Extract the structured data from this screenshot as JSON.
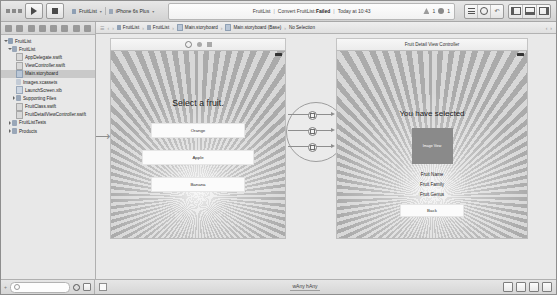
{
  "toolbar": {
    "run_label": "run-button",
    "stop_label": "stop-button",
    "scheme_name": "FruitList",
    "destination": "iPhone 6s Plus",
    "activity": {
      "project": "FruitList",
      "task": "Convert FruitList:",
      "status": "Failed",
      "time": "Today at 10:43",
      "warning_count": "1",
      "error_count": "1"
    },
    "editor_modes": [
      "standard-editor",
      "assistant-editor",
      "version-editor"
    ],
    "panel_toggles": [
      "navigator-toggle",
      "debug-area-toggle",
      "utilities-toggle"
    ]
  },
  "navigator": {
    "tabs": [
      "project-navigator-tab",
      "symbol-navigator-tab",
      "find-navigator-tab",
      "issue-navigator-tab",
      "test-navigator-tab",
      "debug-navigator-tab",
      "breakpoint-navigator-tab",
      "report-navigator-tab"
    ],
    "tree": [
      {
        "label": "FruitList",
        "indent": 0,
        "icon": "proj",
        "twist": "open",
        "selected": false
      },
      {
        "label": "FruitList",
        "indent": 1,
        "icon": "fold",
        "twist": "open",
        "selected": false
      },
      {
        "label": "AppDelegate.swift",
        "indent": 2,
        "icon": "swift",
        "twist": "none",
        "selected": false
      },
      {
        "label": "ViewController.swift",
        "indent": 2,
        "icon": "swift",
        "twist": "none",
        "selected": false
      },
      {
        "label": "Main.storyboard",
        "indent": 2,
        "icon": "story",
        "twist": "none",
        "selected": true
      },
      {
        "label": "Images.xcassets",
        "indent": 2,
        "icon": "assets",
        "twist": "none",
        "selected": false
      },
      {
        "label": "LaunchScreen.xib",
        "indent": 2,
        "icon": "xib",
        "twist": "none",
        "selected": false
      },
      {
        "label": "Supporting Files",
        "indent": 2,
        "icon": "fold",
        "twist": "closed",
        "selected": false
      },
      {
        "label": "FruitClass.swift",
        "indent": 2,
        "icon": "swift",
        "twist": "none",
        "selected": false
      },
      {
        "label": "FruitDetailViewController.swift",
        "indent": 2,
        "icon": "swift",
        "twist": "none",
        "selected": false
      },
      {
        "label": "FruitListTests",
        "indent": 1,
        "icon": "fold",
        "twist": "closed",
        "selected": false
      },
      {
        "label": "Products",
        "indent": 1,
        "icon": "fold",
        "twist": "closed",
        "selected": false
      }
    ],
    "filter_placeholder": ""
  },
  "jumpbar": {
    "crumbs": [
      {
        "label": "FruitList",
        "icon": "p"
      },
      {
        "label": "FruitList",
        "icon": "f"
      },
      {
        "label": "Main.storyboard",
        "icon": "s"
      },
      {
        "label": "Main.storyboard (Base)",
        "icon": "s"
      },
      {
        "label": "No Selection",
        "icon": ""
      }
    ]
  },
  "canvas": {
    "scene_left": {
      "dock_icons": [
        "view-controller-icon",
        "first-responder-icon",
        "exit-icon"
      ],
      "title": "Select a fruit.",
      "buttons": [
        "Orange",
        "Apple",
        "Banana"
      ]
    },
    "scene_right": {
      "dock_title": "Fruit Detail View Controller",
      "title": "You have selected",
      "image_view_label": "Image View",
      "labels": [
        "Fruit Name",
        "Fruit Family",
        "Fruit Genus"
      ],
      "back_button": "Back"
    },
    "segue_count": 3
  },
  "bottombar": {
    "size_class": "wAny hAny",
    "ib_tools": [
      "align-button",
      "pin-button",
      "resolve-issues-button",
      "embed-in-stack-button"
    ],
    "zoom_controls": [
      "zoom-out-button",
      "zoom-fit-button"
    ]
  }
}
